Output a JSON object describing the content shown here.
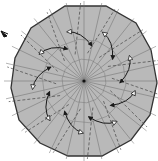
{
  "diagram": {
    "type": "origami-step",
    "shape": "tetradecagon",
    "sides": 14,
    "fill_color": "#b9b9b9",
    "outline_color": "#333333",
    "valley_fold_color": "#444444",
    "crease_color": "#6a6a6a",
    "arrow_color": "#1a1a1a",
    "center": [
      84,
      81
    ],
    "pointer_arrow": {
      "icon": "pointer-arrow-icon",
      "x": 5,
      "y": 34
    },
    "fold_arrows_count": 9,
    "labels": []
  }
}
